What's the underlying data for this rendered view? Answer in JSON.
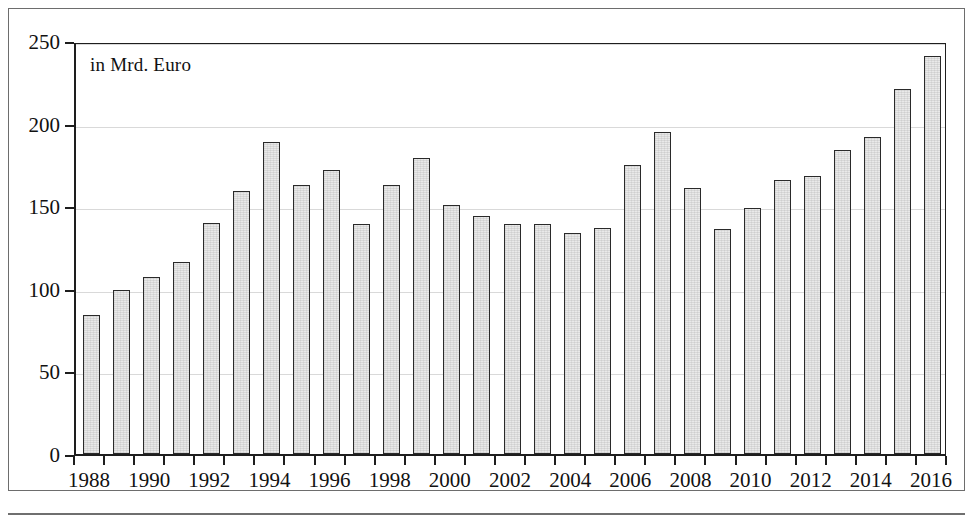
{
  "figure": {
    "note": "in Mrd. Euro"
  },
  "chart_data": {
    "type": "bar",
    "title": "",
    "subtitle": "",
    "annotation": "in Mrd. Euro",
    "xlabel": "",
    "ylabel": "",
    "ylim": [
      0,
      250
    ],
    "ytick_labels": [
      "0",
      "50",
      "100",
      "150",
      "200",
      "250"
    ],
    "yticks": [
      0,
      50,
      100,
      150,
      200,
      250
    ],
    "grid": true,
    "grid_axis": "y",
    "legend": null,
    "bar_color": "#e9e9e9",
    "bar_edge_color": "#2a2a2a",
    "xtick_labels": [
      "1988",
      "1990",
      "1992",
      "1994",
      "1996",
      "1998",
      "2000",
      "2002",
      "2004",
      "2006",
      "2008",
      "2010",
      "2012",
      "2014",
      "2016"
    ],
    "categories": [
      "1988",
      "1989",
      "1990",
      "1991",
      "1992",
      "1993",
      "1994",
      "1995",
      "1996",
      "1997",
      "1998",
      "1999",
      "2000",
      "2001",
      "2002",
      "2003",
      "2004",
      "2005",
      "2006",
      "2007",
      "2008",
      "2009",
      "2010",
      "2011",
      "2012",
      "2013",
      "2014",
      "2015",
      "2016"
    ],
    "values": [
      84,
      99,
      107,
      116,
      140,
      159,
      189,
      163,
      172,
      139,
      163,
      179,
      151,
      144,
      139,
      139,
      134,
      137,
      175,
      195,
      161,
      136,
      149,
      166,
      168,
      184,
      192,
      221,
      241
    ]
  }
}
